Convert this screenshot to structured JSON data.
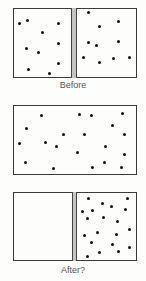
{
  "figure": {
    "panels": [
      {
        "name": "before",
        "caption": "Before",
        "box": {
          "x": 13,
          "y": 8,
          "w": 124,
          "h": 70
        },
        "partition": {
          "x": 71,
          "w": 6
        },
        "dots": [
          [
            19,
            23
          ],
          [
            27,
            20
          ],
          [
            58,
            23
          ],
          [
            42,
            32
          ],
          [
            26,
            48
          ],
          [
            38,
            52
          ],
          [
            58,
            43
          ],
          [
            28,
            69
          ],
          [
            49,
            73
          ],
          [
            58,
            63
          ],
          [
            88,
            12
          ],
          [
            118,
            21
          ],
          [
            99,
            26
          ],
          [
            88,
            42
          ],
          [
            96,
            45
          ],
          [
            118,
            41
          ],
          [
            83,
            57
          ],
          [
            99,
            62
          ],
          [
            113,
            58
          ],
          [
            129,
            57
          ]
        ]
      },
      {
        "name": "removed-partition",
        "caption": "",
        "box": {
          "x": 13,
          "y": 105,
          "w": 124,
          "h": 70
        },
        "partition": null,
        "dots": [
          [
            41,
            115
          ],
          [
            79,
            114
          ],
          [
            91,
            115
          ],
          [
            122,
            113
          ],
          [
            26,
            128
          ],
          [
            112,
            125
          ],
          [
            63,
            134
          ],
          [
            84,
            134
          ],
          [
            124,
            134
          ],
          [
            19,
            143
          ],
          [
            45,
            142
          ],
          [
            56,
            146
          ],
          [
            105,
            146
          ],
          [
            77,
            152
          ],
          [
            124,
            154
          ],
          [
            25,
            162
          ],
          [
            53,
            168
          ],
          [
            92,
            167
          ],
          [
            104,
            162
          ],
          [
            121,
            167
          ]
        ]
      },
      {
        "name": "after",
        "caption": "After?",
        "box": {
          "x": 13,
          "y": 192,
          "w": 124,
          "h": 69
        },
        "partition": {
          "x": 72,
          "w": 5
        },
        "dots": [
          [
            88,
            198
          ],
          [
            127,
            198
          ],
          [
            102,
            203
          ],
          [
            111,
            206
          ],
          [
            82,
            211
          ],
          [
            92,
            210
          ],
          [
            125,
            209
          ],
          [
            87,
            218
          ],
          [
            103,
            217
          ],
          [
            117,
            221
          ],
          [
            97,
            232
          ],
          [
            129,
            229
          ],
          [
            84,
            235
          ],
          [
            116,
            234
          ],
          [
            91,
            242
          ],
          [
            112,
            244
          ],
          [
            129,
            247
          ],
          [
            99,
            252
          ],
          [
            118,
            251
          ],
          [
            87,
            256
          ]
        ]
      }
    ],
    "captions": {
      "before": "Before",
      "after": "After?"
    },
    "colors": {
      "dot": "#111111",
      "partition": "#c4c4c4",
      "border": "#3a3a3a",
      "caption": "#555555"
    }
  }
}
